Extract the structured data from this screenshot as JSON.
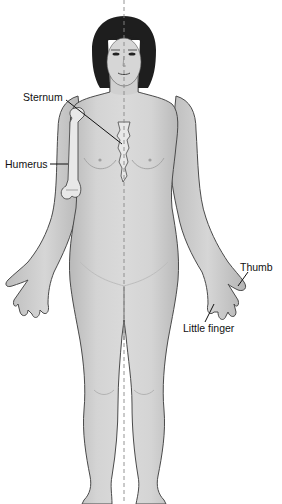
{
  "figure": {
    "colors": {
      "skin": "#d2d2d2",
      "skin_shade": "#b8b8b8",
      "outline": "#4a4a4a",
      "hair": "#1e1e1e",
      "bone": "#e6e6e6",
      "midline": "#888888",
      "label_text": "#111111",
      "background": "#ffffff"
    },
    "labels": [
      {
        "id": "sternum",
        "text": "Sternum"
      },
      {
        "id": "humerus",
        "text": "Humerus"
      },
      {
        "id": "thumb",
        "text": "Thumb"
      },
      {
        "id": "little_finger",
        "text": "Little finger"
      }
    ],
    "midline": {
      "style": "dashed",
      "description": "midsagittal line"
    }
  }
}
